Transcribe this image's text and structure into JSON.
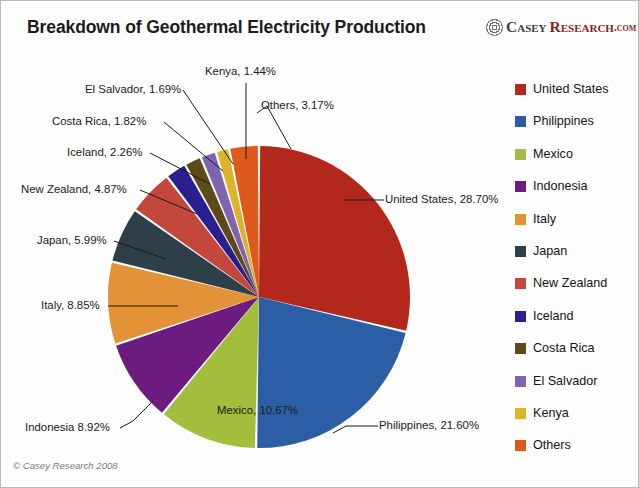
{
  "chart_data": {
    "type": "pie",
    "title": "Breakdown of Geothermal Electricity Production",
    "xlabel": "",
    "ylabel": "",
    "legend_position": "right",
    "start_angle_deg": 0,
    "direction": "clockwise",
    "categories": [
      "United States",
      "Philippines",
      "Mexico",
      "Indonesia",
      "Italy",
      "Japan",
      "New Zealand",
      "Iceland",
      "Costa Rica",
      "El Salvador",
      "Kenya",
      "Others"
    ],
    "values": [
      28.7,
      21.6,
      10.67,
      8.92,
      8.85,
      5.99,
      4.87,
      2.26,
      1.82,
      1.69,
      1.44,
      3.17
    ],
    "unit": "%",
    "colors": [
      "#b2281c",
      "#2c5ea6",
      "#a3bd3c",
      "#6c1b7e",
      "#e39337",
      "#2d3f48",
      "#c2473c",
      "#2b1f8f",
      "#5c4a18",
      "#8064b0",
      "#dcb429",
      "#de5a1c"
    ],
    "slice_labels": [
      "United States, 28.70%",
      "Philippines, 21.60%",
      "Mexico, 10.67%",
      "Indonesia 8.92%",
      "Italy, 8.85%",
      "Japan, 5.99%",
      "New Zealand, 4.87%",
      "Iceland, 2.26%",
      "Costa Rica, 1.82%",
      "El Salvador, 1.69%",
      "Kenya, 1.44%",
      "Others, 3.17%"
    ]
  },
  "header": {
    "title": "Breakdown of Geothermal Electricity Production"
  },
  "logo": {
    "casey": "Casey",
    "research": "Research",
    "dotcom": ".com"
  },
  "legend": {
    "items": [
      {
        "label": "United States",
        "color": "#b2281c"
      },
      {
        "label": "Philippines",
        "color": "#2c5ea6"
      },
      {
        "label": "Mexico",
        "color": "#a3bd3c"
      },
      {
        "label": "Indonesia",
        "color": "#6c1b7e"
      },
      {
        "label": "Italy",
        "color": "#e39337"
      },
      {
        "label": "Japan",
        "color": "#2d3f48"
      },
      {
        "label": "New Zealand",
        "color": "#c2473c"
      },
      {
        "label": "Iceland",
        "color": "#2b1f8f"
      },
      {
        "label": "Costa Rica",
        "color": "#5c4a18"
      },
      {
        "label": "El Salvador",
        "color": "#8064b0"
      },
      {
        "label": "Kenya",
        "color": "#dcb429"
      },
      {
        "label": "Others",
        "color": "#de5a1c"
      }
    ]
  },
  "callouts": {
    "united_states": "United States, 28.70%",
    "philippines": "Philippines, 21.60%",
    "mexico": "Mexico, 10.67%",
    "indonesia": "Indonesia 8.92%",
    "italy": "Italy, 8.85%",
    "japan": "Japan, 5.99%",
    "new_zealand": "New Zealand, 4.87%",
    "iceland": "Iceland, 2.26%",
    "costa_rica": "Costa Rica, 1.82%",
    "el_salvador": "El Salvador, 1.69%",
    "kenya": "Kenya, 1.44%",
    "others": "Others, 3.17%"
  },
  "footer": {
    "copyright": "© Casey Research 2008"
  }
}
